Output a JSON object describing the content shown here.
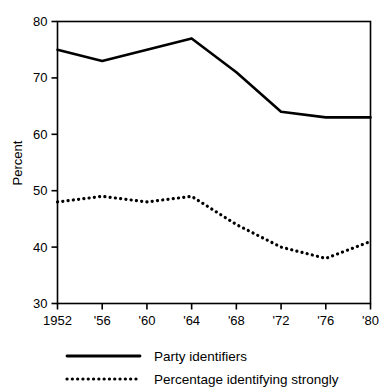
{
  "chart_data": {
    "type": "line",
    "title": "",
    "subtitle": "",
    "xlabel": "",
    "ylabel": "Percent",
    "xlim": [
      1952,
      1980
    ],
    "ylim": [
      30,
      80
    ],
    "grid": false,
    "legend_position": "bottom-left",
    "x": [
      1952,
      1956,
      1960,
      1964,
      1968,
      1972,
      1976,
      1980
    ],
    "x_tick_labels": [
      "1952",
      "'56",
      "'60",
      "'64",
      "'68",
      "'72",
      "'76",
      "'80"
    ],
    "y_tick_labels": [
      "30",
      "40",
      "50",
      "60",
      "70",
      "80"
    ],
    "y_ticks": [
      30,
      40,
      50,
      60,
      70,
      80
    ],
    "series": [
      {
        "name": "Party identifiers",
        "style": "solid",
        "color": "#000000",
        "values": [
          75,
          73,
          75,
          77,
          71,
          64,
          63,
          63
        ]
      },
      {
        "name": "Percentage identifying strongly",
        "style": "dotted",
        "color": "#000000",
        "values": [
          48,
          49,
          48,
          49,
          44,
          40,
          38,
          41
        ]
      }
    ]
  },
  "legend": {
    "items": [
      {
        "label": "Party identifiers",
        "style": "solid"
      },
      {
        "label": "Percentage identifying strongly",
        "style": "dotted"
      }
    ]
  },
  "axes": {
    "y_title": "Percent"
  }
}
